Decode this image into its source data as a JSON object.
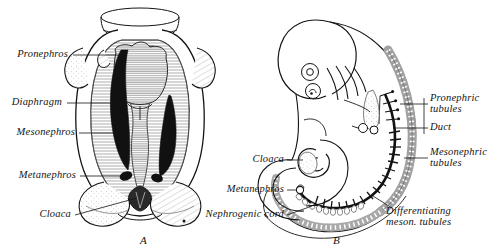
{
  "figure": {
    "type": "embryology-plate",
    "background_color": "#ffffff",
    "ink_color": "#141414"
  },
  "panels": [
    {
      "letter": "A",
      "name": "panel-a",
      "description": "Ventral dissection view of embryo trunk showing paired nephric organs"
    },
    {
      "letter": "B",
      "name": "panel-b",
      "description": "Lateral view of curled embryo showing nephric duct and tubules along the trunk"
    }
  ],
  "labels_left": [
    {
      "id": "pronephros",
      "text": "Pronephros"
    },
    {
      "id": "diaphragm",
      "text": "Diaphragm"
    },
    {
      "id": "mesonephros",
      "text": "Mesonephros"
    },
    {
      "id": "metanephros",
      "text": "Metanephros"
    },
    {
      "id": "cloaca",
      "text": "Cloaca"
    }
  ],
  "labels_middle": [
    {
      "id": "cloaca-b",
      "text": "Cloaca"
    },
    {
      "id": "metanephros-b",
      "text": "Metanephros"
    },
    {
      "id": "nephrogenic-cord",
      "text": "Nephrogenic cord"
    }
  ],
  "labels_right": [
    {
      "id": "pronephric-tubules",
      "line1": "Pronephric",
      "line2": "tubules"
    },
    {
      "id": "duct",
      "line1": "Duct",
      "line2": ""
    },
    {
      "id": "mesonephric-tubules",
      "line1": "Mesonephric",
      "line2": "tubules"
    }
  ],
  "labels_bottom_right": [
    {
      "id": "differentiating-meson-tubules",
      "line1": "Differentiating",
      "line2": "meson. tubules"
    }
  ]
}
